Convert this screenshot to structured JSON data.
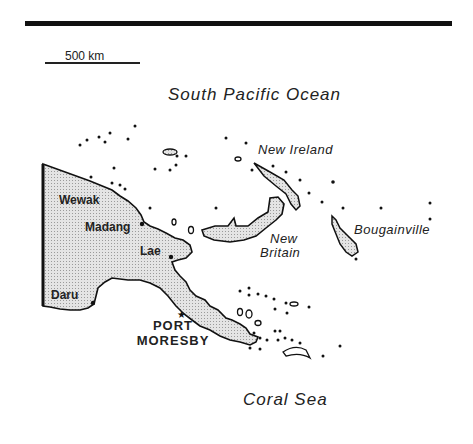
{
  "map": {
    "scale": {
      "label": "500 km"
    },
    "water": {
      "north": "South Pacific Ocean",
      "south": "Coral Sea"
    },
    "islands": {
      "new_ireland": "New Ireland",
      "new_britain_1": "New",
      "new_britain_2": "Britain",
      "bougainville": "Bougainville"
    },
    "cities": {
      "wewak": "Wewak",
      "madang": "Madang",
      "lae": "Lae",
      "daru": "Daru",
      "capital_1": "PORT",
      "capital_2": "MORESBY"
    },
    "colors": {
      "land_fill": "#d6d6d6",
      "outline": "#111111",
      "background": "#ffffff"
    }
  }
}
